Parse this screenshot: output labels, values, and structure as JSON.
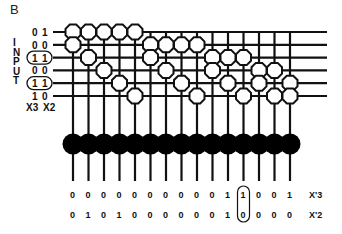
{
  "panel_label": "B",
  "input_label": "INPUT",
  "input_header": [
    "X3",
    "X2"
  ],
  "rows": [
    {
      "x3": "0",
      "x2": "1",
      "circled": false,
      "nodes": [
        1,
        2,
        3,
        4,
        5
      ]
    },
    {
      "x3": "0",
      "x2": "0",
      "circled": false,
      "nodes": [
        1,
        6,
        7,
        8,
        9
      ]
    },
    {
      "x3": "1",
      "x2": "1",
      "circled": true,
      "nodes": [
        2,
        6,
        10,
        11,
        12
      ]
    },
    {
      "x3": "0",
      "x2": "0",
      "circled": false,
      "nodes": [
        3,
        7,
        10,
        13,
        14
      ]
    },
    {
      "x3": "1",
      "x2": "1",
      "circled": true,
      "nodes": [
        4,
        8,
        11,
        13,
        15
      ]
    },
    {
      "x3": "1",
      "x2": "0",
      "circled": false,
      "nodes": [
        5,
        9,
        12,
        14,
        15
      ]
    }
  ],
  "column_count": 15,
  "outputs": {
    "x3_label": "X'3",
    "x2_label": "X'2",
    "x3": [
      "0",
      "0",
      "0",
      "0",
      "0",
      "0",
      "0",
      "0",
      "0",
      "0",
      "1",
      "1",
      "0",
      "0",
      "1"
    ],
    "x2": [
      "0",
      "1",
      "0",
      "1",
      "0",
      "0",
      "0",
      "0",
      "0",
      "0",
      "1",
      "0",
      "0",
      "0",
      "0"
    ],
    "circled_column": 12
  },
  "colors": {
    "line": "#111111",
    "node_fill": "#ffffff",
    "output_unit": "#000000"
  }
}
